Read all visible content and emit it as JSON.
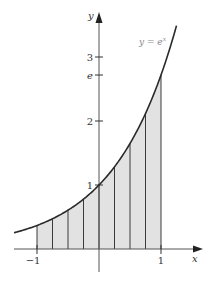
{
  "figure": {
    "function_label": "y = e",
    "function_label_exp": "x",
    "x_axis_label": "x",
    "y_axis_label": "y",
    "x_ticks": [
      {
        "value": -1,
        "label": "−1"
      },
      {
        "value": 1,
        "label": "1"
      }
    ],
    "y_ticks": [
      {
        "value": 1,
        "label": "1"
      },
      {
        "value": 2,
        "label": "2"
      },
      {
        "value": 2.71828,
        "label": "e"
      },
      {
        "value": 3,
        "label": "3"
      }
    ],
    "domain_shaded": [
      -1,
      1
    ],
    "num_strips": 8,
    "curve_range": [
      -1.37,
      1.25
    ],
    "colors": {
      "axis": "#555555",
      "curve": "#2a2a2a",
      "shade": "#e2e2e2",
      "strip_line": "#3a3a3a",
      "curve_label": "#8a8a8a"
    }
  }
}
